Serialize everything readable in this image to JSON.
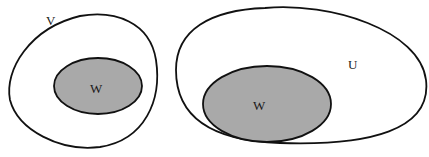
{
  "diagram": {
    "left": {
      "outer_label": "V",
      "inner_label": "W"
    },
    "right": {
      "outer_label": "U",
      "inner_label": "W"
    },
    "colors": {
      "background": "#ffffff",
      "stroke": "#111111",
      "fill_inner": "#a9a9a9",
      "fill_outer": "#ffffff"
    }
  }
}
